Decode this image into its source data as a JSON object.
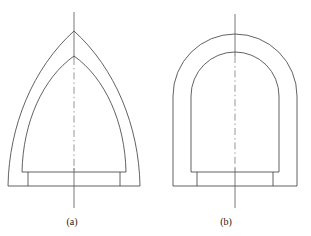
{
  "figure": {
    "stroke_color": "#3a3a3a",
    "centerline_color": "#8a8a8a",
    "background_color": "#ffffff",
    "panels": [
      {
        "id": "a",
        "caption": "(a)",
        "shape_name": "pointed-arch-section",
        "description": "Pointed (ogival) arch lining with stepped base",
        "axis_x": 74,
        "outer_apex_y": 31,
        "inner_apex_y": 56,
        "springing_y": 186,
        "outer_half_span": 66,
        "inner_half_span": 52,
        "base_top_y": 172,
        "base_bottom_y": 186,
        "base_half_width": 46,
        "plinth_half_width": 60
      },
      {
        "id": "b",
        "caption": "(b)",
        "shape_name": "round-arch-section",
        "description": "Semicircular crown arch lining with vertical side walls and stepped base",
        "axis_x": 235,
        "outer_crown_y": 34,
        "inner_crown_y": 52,
        "springing_y": 186,
        "outer_half_span": 62,
        "inner_half_span": 44,
        "outer_haunch_y": 96,
        "inner_haunch_y": 96,
        "base_top_y": 172,
        "base_bottom_y": 186,
        "base_half_width": 46,
        "plinth_half_width": 62
      }
    ]
  }
}
